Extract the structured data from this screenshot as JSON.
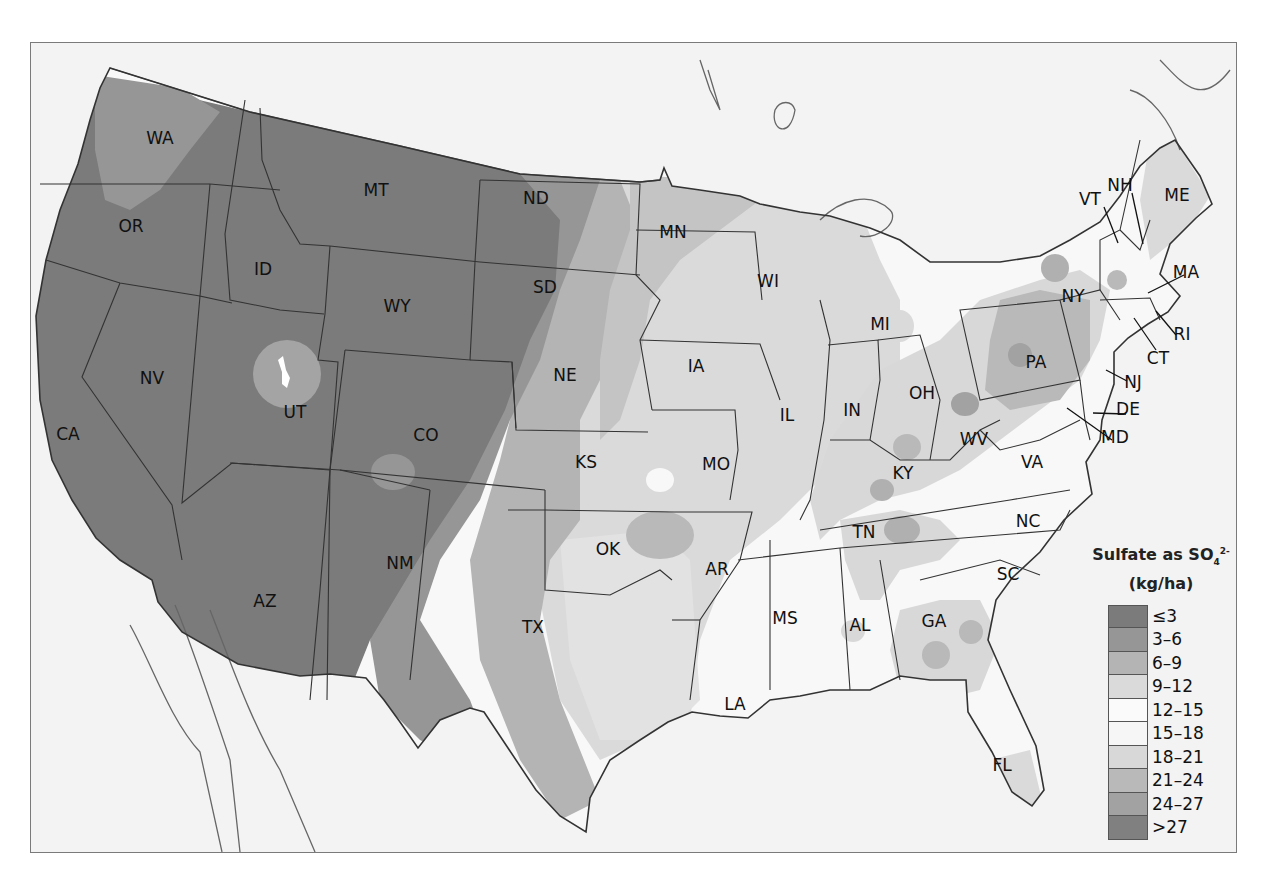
{
  "map": {
    "title": "Sulfate as SO4 2- (kg/ha)",
    "subject": "Sulfate wet deposition, contiguous United States",
    "colors": {
      "background_land_outside_us": "#f3f3f3",
      "frame": "#7a7a7a",
      "border": "#333333",
      "coast": "#666666"
    }
  },
  "legend": {
    "title_line1_prefix": "Sulfate as SO",
    "title_subscript": "4",
    "title_superscript": "2-",
    "title_line2": "(kg/ha)",
    "classes": [
      {
        "label": "≤3",
        "color": "#7b7b7b"
      },
      {
        "label": "3–6",
        "color": "#969696"
      },
      {
        "label": "6–9",
        "color": "#b4b4b4"
      },
      {
        "label": "9–12",
        "color": "#dadada"
      },
      {
        "label": "12–15",
        "color": "#fafafa"
      },
      {
        "label": "15–18",
        "color": "#f6f6f6"
      },
      {
        "label": "18–21",
        "color": "#d8d8d8"
      },
      {
        "label": "21–24",
        "color": "#b9b9b9"
      },
      {
        "label": "24–27",
        "color": "#a2a2a2"
      },
      {
        "label": ">27",
        "color": "#808080"
      }
    ]
  },
  "states": [
    {
      "abbr": "WA",
      "x": 160,
      "y": 144
    },
    {
      "abbr": "OR",
      "x": 131,
      "y": 232
    },
    {
      "abbr": "CA",
      "x": 68,
      "y": 440
    },
    {
      "abbr": "NV",
      "x": 152,
      "y": 384
    },
    {
      "abbr": "ID",
      "x": 263,
      "y": 275
    },
    {
      "abbr": "MT",
      "x": 376,
      "y": 196
    },
    {
      "abbr": "WY",
      "x": 397,
      "y": 312
    },
    {
      "abbr": "UT",
      "x": 295,
      "y": 418
    },
    {
      "abbr": "CO",
      "x": 426,
      "y": 441
    },
    {
      "abbr": "AZ",
      "x": 265,
      "y": 607
    },
    {
      "abbr": "NM",
      "x": 400,
      "y": 569
    },
    {
      "abbr": "ND",
      "x": 536,
      "y": 204
    },
    {
      "abbr": "SD",
      "x": 545,
      "y": 293
    },
    {
      "abbr": "NE",
      "x": 565,
      "y": 381
    },
    {
      "abbr": "KS",
      "x": 586,
      "y": 468
    },
    {
      "abbr": "OK",
      "x": 608,
      "y": 555
    },
    {
      "abbr": "TX",
      "x": 533,
      "y": 633
    },
    {
      "abbr": "MN",
      "x": 673,
      "y": 238
    },
    {
      "abbr": "IA",
      "x": 696,
      "y": 372
    },
    {
      "abbr": "MO",
      "x": 716,
      "y": 470
    },
    {
      "abbr": "AR",
      "x": 717,
      "y": 575
    },
    {
      "abbr": "LA",
      "x": 735,
      "y": 710
    },
    {
      "abbr": "WI",
      "x": 768,
      "y": 287
    },
    {
      "abbr": "IL",
      "x": 787,
      "y": 421
    },
    {
      "abbr": "MS",
      "x": 785,
      "y": 624
    },
    {
      "abbr": "MI",
      "x": 880,
      "y": 330
    },
    {
      "abbr": "IN",
      "x": 852,
      "y": 416
    },
    {
      "abbr": "KY",
      "x": 903,
      "y": 479
    },
    {
      "abbr": "TN",
      "x": 864,
      "y": 538
    },
    {
      "abbr": "AL",
      "x": 860,
      "y": 631
    },
    {
      "abbr": "GA",
      "x": 934,
      "y": 627
    },
    {
      "abbr": "FL",
      "x": 1002,
      "y": 771
    },
    {
      "abbr": "SC",
      "x": 1008,
      "y": 580
    },
    {
      "abbr": "NC",
      "x": 1028,
      "y": 527
    },
    {
      "abbr": "VA",
      "x": 1032,
      "y": 468
    },
    {
      "abbr": "WV",
      "x": 974,
      "y": 445
    },
    {
      "abbr": "OH",
      "x": 922,
      "y": 399
    },
    {
      "abbr": "PA",
      "x": 1036,
      "y": 368
    },
    {
      "abbr": "NY",
      "x": 1073,
      "y": 302
    },
    {
      "abbr": "ME",
      "x": 1177,
      "y": 201
    }
  ],
  "leader_labels": [
    {
      "abbr": "VT",
      "x": 1090,
      "y": 205,
      "line": [
        1104,
        207,
        1118,
        243
      ]
    },
    {
      "abbr": "NH",
      "x": 1120,
      "y": 191,
      "line": [
        1132,
        193,
        1143,
        244
      ]
    },
    {
      "abbr": "MA",
      "x": 1186,
      "y": 278,
      "line": [
        1184,
        275,
        1148,
        293
      ]
    },
    {
      "abbr": "RI",
      "x": 1182,
      "y": 340,
      "line": [
        1176,
        335,
        1156,
        311
      ]
    },
    {
      "abbr": "CT",
      "x": 1158,
      "y": 364,
      "line": [
        1156,
        350,
        1134,
        318
      ]
    },
    {
      "abbr": "NJ",
      "x": 1133,
      "y": 388,
      "line": [
        1127,
        381,
        1106,
        370
      ]
    },
    {
      "abbr": "DE",
      "x": 1128,
      "y": 415,
      "line": [
        1126,
        414,
        1093,
        413
      ]
    },
    {
      "abbr": "MD",
      "x": 1115,
      "y": 443,
      "line": [
        1112,
        440,
        1067,
        408
      ]
    }
  ]
}
